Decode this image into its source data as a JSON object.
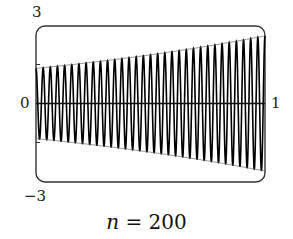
{
  "chart_data": {
    "type": "line",
    "title": "",
    "caption": "n = 200",
    "caption_var": "n",
    "caption_eq": " = 200",
    "xlabel": "",
    "ylabel": "",
    "xlim": [
      0,
      1
    ],
    "ylim": [
      -3,
      3
    ],
    "x_tick_labels": [
      "0",
      "1"
    ],
    "y_tick_labels": [
      "3",
      "-3"
    ],
    "y_minor_ticks": [
      1.5,
      -1.5
    ],
    "zero_line": true,
    "grid": false,
    "legend": null,
    "series": [
      {
        "name": "oscillating signal (n = 200)",
        "description": "rapid sinusoidal oscillation with exponentially growing envelope",
        "visible_periods": 32,
        "envelope_start": 1.35,
        "envelope_end": 2.6,
        "envelope_samples": {
          "x": [
            0,
            0.25,
            0.5,
            0.75,
            1.0
          ],
          "amplitude": [
            1.35,
            1.6,
            1.9,
            2.2,
            2.6
          ]
        }
      }
    ]
  },
  "labels": {
    "y_top": "3",
    "y_bottom": "−3",
    "x_left": "0",
    "x_right": "1"
  }
}
